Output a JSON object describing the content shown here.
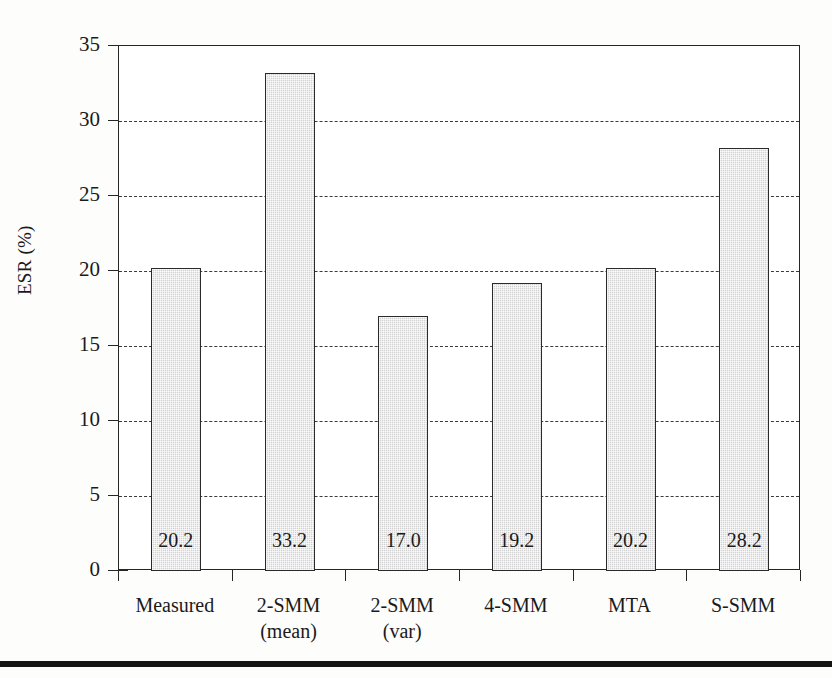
{
  "chart_data": {
    "type": "bar",
    "title": "",
    "subtitle": "",
    "xlabel": "",
    "ylabel": "ESR (%)",
    "ylim": [
      0,
      35
    ],
    "ytick_step": 5,
    "yticks": [
      0,
      5,
      10,
      15,
      20,
      25,
      30,
      35
    ],
    "ytick_labels": [
      "0",
      "5",
      "10",
      "15",
      "20",
      "25",
      "30",
      "35"
    ],
    "grid": "horizontal-dashed",
    "legend": "none",
    "categories": [
      "Measured",
      "2-SMM (mean)",
      "2-SMM (var)",
      "4-SMM",
      "MTA",
      "S-SMM"
    ],
    "category_label_lines": [
      [
        "Measured"
      ],
      [
        "2-SMM",
        "(mean)"
      ],
      [
        "2-SMM",
        "(var)"
      ],
      [
        "4-SMM"
      ],
      [
        "MTA"
      ],
      [
        "S-SMM"
      ]
    ],
    "values": [
      20.2,
      33.2,
      17.0,
      19.2,
      20.2,
      28.2
    ],
    "value_labels": [
      "20.2",
      "33.2",
      "17.0",
      "19.2",
      "20.2",
      "28.2"
    ],
    "bar_fill_color": "#d2d2d2",
    "bar_edge_color": "#2a2a2a",
    "axis_color": "#262626",
    "grid_color": "#3a3a3a",
    "background_color": "#ffffff"
  },
  "figure": {
    "bottom_rule_color": "#141414"
  }
}
